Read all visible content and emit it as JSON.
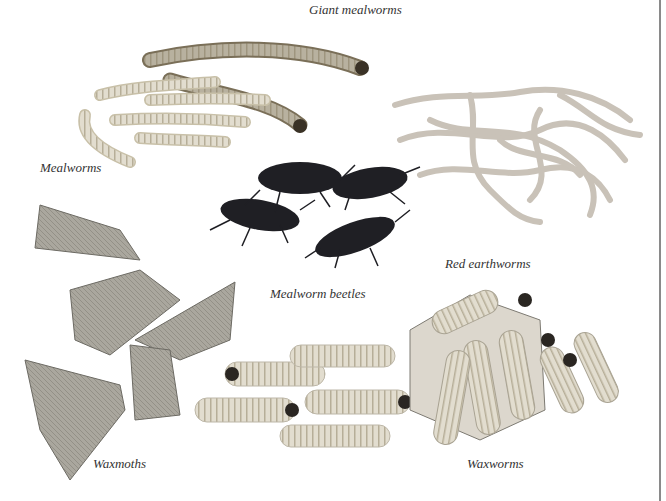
{
  "labels": {
    "giant_mealworms": "Giant mealworms",
    "mealworms": "Mealworms",
    "red_earthworms": "Red earthworms",
    "mealworm_beetles": "Mealworm beetles",
    "waxmoths": "Waxmoths",
    "waxworms": "Waxworms"
  },
  "colors": {
    "larva": "#ddd8c8",
    "larva_stripe": "#b8b09a",
    "earthworm": "#d4cdc4",
    "beetle": "#1e1e22",
    "moth": "#a8a59c",
    "honeycomb": "#cfcac0",
    "divider": "#8a8a8a"
  }
}
